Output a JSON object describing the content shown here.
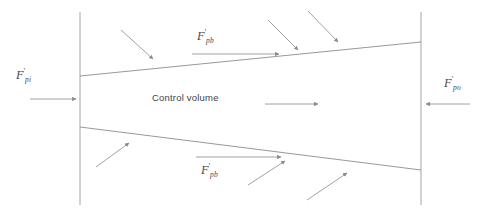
{
  "diagram": {
    "background_color": "#ffffff",
    "line_color": "#8c8c8c",
    "arrow_color": "#8a8a8a",
    "text_color": "#4a4a4a",
    "center_label": "Control volume",
    "labels": {
      "inlet": {
        "symbol": "F",
        "prime": "'",
        "subscript": "pi"
      },
      "outlet": {
        "symbol": "F",
        "prime": "'",
        "subscript": "po"
      },
      "top_boundary": {
        "symbol": "F",
        "prime": "'",
        "subscript": "pb"
      },
      "bottom_boundary": {
        "symbol": "F",
        "prime": "'",
        "subscript": "pb"
      }
    },
    "geometry": {
      "left_boundary_x": 80,
      "right_boundary_x": 421,
      "boundary_top_y": 12,
      "boundary_bottom_y": 205,
      "top_edge": {
        "x1": 80,
        "y1": 76,
        "x2": 421,
        "y2": 42
      },
      "bottom_edge": {
        "x1": 80,
        "y1": 127,
        "x2": 421,
        "y2": 170
      }
    },
    "arrows": {
      "inlet_flow": {
        "from_x": 30,
        "from_y": 99,
        "to_x": 79,
        "to_y": 99,
        "direction": "right"
      },
      "outlet_flow": {
        "from_x": 470,
        "from_y": 104,
        "to_x": 423,
        "to_y": 104,
        "direction": "left"
      },
      "center_flow": {
        "from_x": 265,
        "from_y": 104,
        "to_x": 322,
        "to_y": 104,
        "direction": "right"
      },
      "top_shear": {
        "from_x": 192,
        "from_y": 54,
        "to_x": 283,
        "to_y": 54,
        "direction": "right"
      },
      "bottom_shear": {
        "from_x": 196,
        "from_y": 157,
        "to_x": 285,
        "to_y": 157,
        "direction": "right"
      },
      "top_incoming": [
        {
          "from_x": 121,
          "from_y": 30,
          "to_x": 156,
          "to_y": 62
        },
        {
          "from_x": 268,
          "from_y": 20,
          "to_x": 301,
          "to_y": 53
        },
        {
          "from_x": 308,
          "from_y": 11,
          "to_x": 341,
          "to_y": 45
        }
      ],
      "bottom_incoming": [
        {
          "from_x": 96,
          "from_y": 167,
          "to_x": 132,
          "to_y": 140
        },
        {
          "from_x": 248,
          "from_y": 185,
          "to_x": 288,
          "to_y": 158
        },
        {
          "from_x": 307,
          "from_y": 200,
          "to_x": 350,
          "to_y": 170
        }
      ]
    }
  }
}
